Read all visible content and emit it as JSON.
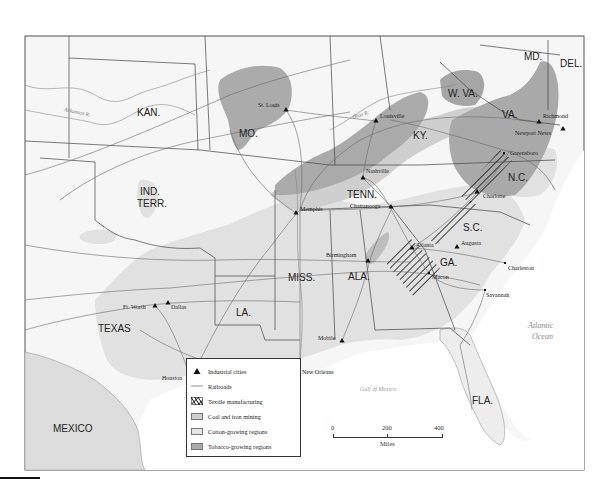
{
  "map": {
    "title": "Industry and agriculture in the New South",
    "colors": {
      "background": "#ffffff",
      "land": "#f4f4f4",
      "cotton": "#e3e3e3",
      "coal_iron": "#d2d2d2",
      "tobacco": "#a9a9a9",
      "border": "#444444",
      "railroad": "#666666",
      "textile": "#111111",
      "mexico": "#dddddd"
    },
    "states": [
      {
        "id": "kan",
        "label": "KAN.",
        "x": 137,
        "y": 116
      },
      {
        "id": "mo",
        "label": "MO.",
        "x": 239,
        "y": 137
      },
      {
        "id": "ky",
        "label": "KY.",
        "x": 413,
        "y": 139
      },
      {
        "id": "wva",
        "label": "W. VA.",
        "x": 456,
        "y": 97
      },
      {
        "id": "va",
        "label": "VA.",
        "x": 505,
        "y": 118
      },
      {
        "id": "md",
        "label": "MD.",
        "x": 526,
        "y": 60
      },
      {
        "id": "del",
        "label": "DEL.",
        "x": 560,
        "y": 67
      },
      {
        "id": "nc",
        "label": "N.C.",
        "x": 508,
        "y": 177
      },
      {
        "id": "tenn",
        "label": "TENN.",
        "x": 349,
        "y": 195
      },
      {
        "id": "ind_terr_1",
        "label": "IND.",
        "x": 139,
        "y": 192
      },
      {
        "id": "ind_terr_2",
        "label": "TERR.",
        "x": 137,
        "y": 204
      },
      {
        "id": "sc",
        "label": "S.C.",
        "x": 465,
        "y": 228
      },
      {
        "id": "ga",
        "label": "GA.",
        "x": 440,
        "y": 261
      },
      {
        "id": "ala",
        "label": "ALA.",
        "x": 349,
        "y": 270
      },
      {
        "id": "miss",
        "label": "MISS.",
        "x": 290,
        "y": 272
      },
      {
        "id": "la",
        "label": "LA.",
        "x": 236,
        "y": 311
      },
      {
        "id": "texas",
        "label": "TEXAS",
        "x": 100,
        "y": 327
      },
      {
        "id": "fla",
        "label": "FLA.",
        "x": 472,
        "y": 400
      }
    ],
    "countries": [
      {
        "id": "mexico",
        "label": "MEXICO",
        "x": 53,
        "y": 429
      }
    ],
    "water": [
      {
        "id": "atlantic_1",
        "label": "Atlantic",
        "x": 528,
        "y": 326
      },
      {
        "id": "atlantic_2",
        "label": "Ocean",
        "x": 532,
        "y": 337
      }
    ],
    "gulf": {
      "label": "Gulf of Mexico",
      "x": 357,
      "y": 389
    },
    "rivers": [
      {
        "id": "arkansas",
        "label": "Arkansas R.",
        "x": 64,
        "y": 113,
        "rotate": 12
      },
      {
        "id": "ohio",
        "label": "Ohio R.",
        "x": 355,
        "y": 117,
        "rotate": -18
      }
    ],
    "cities": [
      {
        "name": "St. Louis",
        "x": 286,
        "y": 110,
        "marker": "triangle",
        "lx": 258,
        "ly": 107
      },
      {
        "name": "Louisville",
        "x": 376,
        "y": 121,
        "marker": "triangle",
        "lx": 380,
        "ly": 118
      },
      {
        "name": "Nashville",
        "x": 363,
        "y": 178,
        "marker": "triangle",
        "lx": 366,
        "ly": 173
      },
      {
        "name": "Richmond",
        "x": 539,
        "y": 122,
        "marker": "triangle",
        "lx": 543,
        "ly": 118
      },
      {
        "name": "Newport News",
        "x": 563,
        "y": 129,
        "marker": "triangle",
        "lx": 515,
        "ly": 135
      },
      {
        "name": "Greensboro",
        "x": 504,
        "y": 153,
        "marker": "dot",
        "lx": 510,
        "ly": 155
      },
      {
        "name": "Charlotte",
        "x": 477,
        "y": 192,
        "marker": "triangle",
        "lx": 483,
        "ly": 198
      },
      {
        "name": "Memphis",
        "x": 296,
        "y": 213,
        "marker": "triangle",
        "lx": 300,
        "ly": 211
      },
      {
        "name": "Chattanooga",
        "x": 391,
        "y": 207,
        "marker": "triangle",
        "lx": 350,
        "ly": 208
      },
      {
        "name": "Atlanta",
        "x": 412,
        "y": 248,
        "marker": "triangle",
        "lx": 416,
        "ly": 247
      },
      {
        "name": "Augusta",
        "x": 457,
        "y": 247,
        "marker": "triangle",
        "lx": 461,
        "ly": 245
      },
      {
        "name": "Birmingham",
        "x": 368,
        "y": 261,
        "marker": "triangle",
        "lx": 326,
        "ly": 257
      },
      {
        "name": "Macon",
        "x": 429,
        "y": 273,
        "marker": "dot",
        "lx": 432,
        "ly": 279
      },
      {
        "name": "Charleston",
        "x": 505,
        "y": 263,
        "marker": "dot",
        "lx": 508,
        "ly": 270
      },
      {
        "name": "Savannah",
        "x": 485,
        "y": 290,
        "marker": "dot",
        "lx": 486,
        "ly": 297
      },
      {
        "name": "Ft. Worth",
        "x": 155,
        "y": 306,
        "marker": "triangle",
        "lx": 123,
        "ly": 309
      },
      {
        "name": "Dallas",
        "x": 168,
        "y": 303,
        "marker": "triangle",
        "lx": 171,
        "ly": 309
      },
      {
        "name": "Mobile",
        "x": 342,
        "y": 341,
        "marker": "triangle",
        "lx": 318,
        "ly": 340
      },
      {
        "name": "New Orleans",
        "x": 298,
        "y": 367,
        "marker": "triangle",
        "lx": 302,
        "ly": 374
      },
      {
        "name": "Houston",
        "x": 192,
        "y": 380,
        "marker": "triangle",
        "lx": 162,
        "ly": 380
      }
    ]
  },
  "legend": {
    "items": [
      {
        "id": "industrial",
        "label": "Industrial cities"
      },
      {
        "id": "railroads",
        "label": "Railroads"
      },
      {
        "id": "textile",
        "label": "Textile manufacturing"
      },
      {
        "id": "coal",
        "label": "Coal and iron mining"
      },
      {
        "id": "cotton",
        "label": "Cotton-growing regions"
      },
      {
        "id": "tobacco",
        "label": "Tobacco-growing regions"
      }
    ]
  },
  "scale": {
    "ticks": [
      "0",
      "200",
      "400"
    ],
    "unit": "Miles"
  }
}
